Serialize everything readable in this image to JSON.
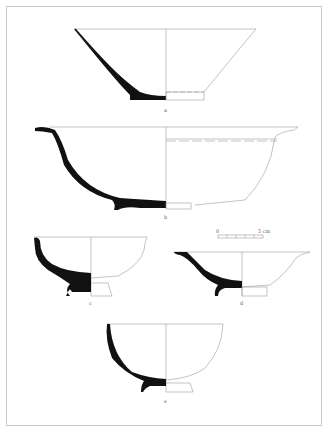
{
  "figure": {
    "type": "archaeological pottery drawing plate",
    "colors": {
      "section_fill": "#111111",
      "outline": "#9a9a9a",
      "frame": "#c8c8c8"
    }
  },
  "vessels": [
    {
      "id": "a",
      "label": "a",
      "form": "conical bowl with low ring foot"
    },
    {
      "id": "b",
      "label": "b",
      "form": "large bowl with everted flanged rim and grooves"
    },
    {
      "id": "c",
      "label": "c",
      "form": "deep bowl with flared rim and ring foot"
    },
    {
      "id": "d",
      "label": "d",
      "form": "shallow bowl with everted rim and ring foot"
    },
    {
      "id": "e",
      "label": "e",
      "form": "hemispherical bowl with ring foot"
    }
  ],
  "scale_bar": {
    "start_label": "0",
    "end_label": "5 cm"
  }
}
